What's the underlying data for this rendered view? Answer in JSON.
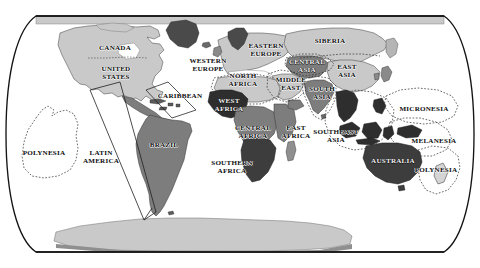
{
  "map": {
    "title": "World regions map",
    "projection": "robinson-oval",
    "background_color": "#ffffff",
    "border_color": "#1a1a1a",
    "colors": {
      "land_light": "#c9c9c9",
      "land_medium": "#8f8f8f",
      "land_dark": "#3d3d3d",
      "outline": "#2b2b2b",
      "dashed_boundary": "#3a3a3a",
      "ocean": "#ffffff",
      "label_light_text": "#f2f2f2",
      "label_dark_text": "#0d0d0d"
    },
    "regions": [
      {
        "name": "CANADA",
        "label": "CANADA",
        "x": 115,
        "y": 49,
        "shade": "land_light",
        "text": "dark"
      },
      {
        "name": "UNITED STATES",
        "label": "UNITED\nSTATES",
        "x": 116,
        "y": 74,
        "shade": "land_light",
        "text": "dark"
      },
      {
        "name": "CARIBBEAN",
        "label": "CARIBBEAN",
        "x": 180,
        "y": 97,
        "shade": "land_medium",
        "text": "dark"
      },
      {
        "name": "LATIN AMERICA",
        "label": "LATIN\nAMERICA",
        "x": 101,
        "y": 158,
        "shade": "land_medium",
        "text": "dark"
      },
      {
        "name": "BRAZIL",
        "label": "BRAZIL",
        "x": 164,
        "y": 146,
        "shade": "land_medium",
        "text": "dark"
      },
      {
        "name": "POLYNESIA-E",
        "label": "POLYNESIA",
        "x": 44,
        "y": 154,
        "shade": "ocean",
        "text": "dark"
      },
      {
        "name": "WESTERN EUROPE",
        "label": "WESTERN\nEUROPE",
        "x": 208,
        "y": 66,
        "shade": "land_light",
        "text": "dark"
      },
      {
        "name": "EASTERN EUROPE",
        "label": "EASTERN\nEUROPE",
        "x": 266,
        "y": 51,
        "shade": "land_light",
        "text": "dark"
      },
      {
        "name": "SIBERIA",
        "label": "SIBERIA",
        "x": 330,
        "y": 42,
        "shade": "land_light",
        "text": "dark"
      },
      {
        "name": "CENTRAL ASIA",
        "label": "CENTRAL\nASIA",
        "x": 307,
        "y": 67,
        "shade": "land_medium",
        "text": "light"
      },
      {
        "name": "EAST ASIA",
        "label": "EAST\nASIA",
        "x": 347,
        "y": 72,
        "shade": "land_light",
        "text": "dark"
      },
      {
        "name": "MIDDLE EAST",
        "label": "MIDDLE\nEAST",
        "x": 291,
        "y": 85,
        "shade": "land_light",
        "text": "dark"
      },
      {
        "name": "SOUTH ASIA",
        "label": "SOUTH\nASIA",
        "x": 322,
        "y": 94,
        "shade": "land_medium",
        "text": "dark"
      },
      {
        "name": "NORTH AFRICA",
        "label": "NORTH\nAFRICA",
        "x": 243,
        "y": 81,
        "shade": "land_light",
        "text": "dark"
      },
      {
        "name": "WEST AFRICA",
        "label": "WEST\nAFRICA",
        "x": 229,
        "y": 106,
        "shade": "land_dark",
        "text": "light"
      },
      {
        "name": "CENTRAL AFRICA",
        "label": "CENTRAL\nAFRICA",
        "x": 253,
        "y": 133,
        "shade": "land_medium",
        "text": "dark"
      },
      {
        "name": "EAST AFRICA",
        "label": "EAST\nAFRICA",
        "x": 296,
        "y": 133,
        "shade": "land_medium",
        "text": "dark"
      },
      {
        "name": "SOUTHERN AFRICA",
        "label": "SOUTHERN\nAFRICA",
        "x": 232,
        "y": 168,
        "shade": "land_dark",
        "text": "dark"
      },
      {
        "name": "SOUTHEAST ASIA",
        "label": "SOUTHEAST\nASIA",
        "x": 336,
        "y": 137,
        "shade": "land_dark",
        "text": "dark"
      },
      {
        "name": "MICRONESIA",
        "label": "MICRONESIA",
        "x": 424,
        "y": 110,
        "shade": "ocean",
        "text": "dark"
      },
      {
        "name": "MELANESIA",
        "label": "MELANESIA",
        "x": 434,
        "y": 142,
        "shade": "ocean",
        "text": "dark"
      },
      {
        "name": "POLYNESIA-W",
        "label": "POLYNESIA",
        "x": 436,
        "y": 171,
        "shade": "ocean",
        "text": "dark"
      },
      {
        "name": "AUSTRALIA",
        "label": "AUSTRALIA",
        "x": 393,
        "y": 162,
        "shade": "land_dark",
        "text": "light"
      }
    ]
  }
}
